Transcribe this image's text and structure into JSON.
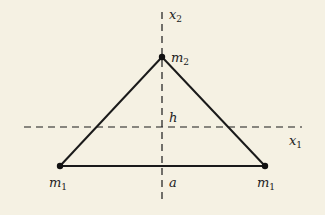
{
  "diagram": {
    "type": "triangle-mass-configuration",
    "background": "#f5f1e3",
    "line_color": "#1a1a1a",
    "axes": {
      "x1": {
        "label": "x",
        "subscript": "1"
      },
      "x2": {
        "label": "x",
        "subscript": "2"
      }
    },
    "masses": [
      {
        "id": "top",
        "label": "m",
        "subscript": "2"
      },
      {
        "id": "left",
        "label": "m",
        "subscript": "1"
      },
      {
        "id": "right",
        "label": "m",
        "subscript": "1"
      }
    ],
    "dimensions": {
      "height_label": "h",
      "half_base_label": "a"
    }
  }
}
